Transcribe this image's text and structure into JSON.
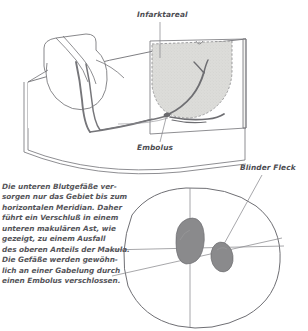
{
  "figure": {
    "language": "de"
  },
  "labels": {
    "infarktareal": "Infarktareal",
    "embolus": "Embolus",
    "blinder_fleck": "Blinder Fleck"
  },
  "caption": {
    "lines": [
      "Die unteren Blutgefäße ver-",
      "sorgen nur das Gebiet bis zum",
      "horizontalen Meridian. Daher",
      "führt ein Verschluß in einem",
      "unteren makulären Ast, wie",
      "gezeigt, zu einem Ausfall",
      "des oberen Anteils der Makula.",
      "Die Gefäße werden gewöhn-",
      "lich an einer Gabelung durch",
      "einen Embolus verschlossen."
    ]
  },
  "colors": {
    "ink": "#6b6b70",
    "ink_dark": "#4d4d52",
    "infarct_fill": "#d9d9d6",
    "vessel": "#6e6e72",
    "scotoma_fill": "#8a8a8c",
    "blindspot_fill": "#8a8a8c",
    "background": "#ffffff"
  },
  "upper_illustration": {
    "name": "retina-fundus-3d-illustration",
    "parts": [
      "optic-disc",
      "retinal-vessel-trunk",
      "lower-macular-branch",
      "embolus-site",
      "infarct-area-shaded",
      "retina-sheet"
    ]
  },
  "lower_illustration": {
    "name": "visual-field-diagram",
    "parts": [
      "visual-field-outline",
      "horizontal-meridian",
      "vertical-meridian",
      "scotoma-defect",
      "blind-spot"
    ]
  }
}
